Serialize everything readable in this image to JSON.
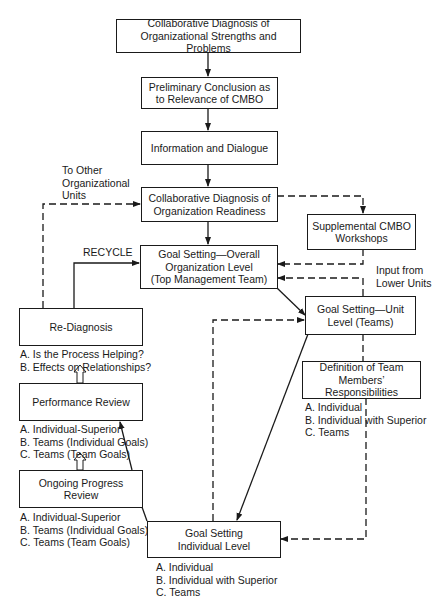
{
  "boxes": {
    "org_diagnosis": {
      "lines": [
        "Collaborative Diagnosis of",
        "Organizational Strengths and Problems"
      ]
    },
    "preliminary": {
      "lines": [
        "Preliminary Conclusion as",
        "to Relevance of CMBO"
      ]
    },
    "information": {
      "lines": [
        "Information and Dialogue"
      ]
    },
    "readiness": {
      "lines": [
        "Collaborative Diagnosis of",
        "Organization Readiness"
      ]
    },
    "supplemental": {
      "lines": [
        "Supplemental CMBO",
        "Workshops"
      ]
    },
    "overall": {
      "lines": [
        "Goal Setting—Overall",
        "Organization Level",
        "(Top Management Team)"
      ]
    },
    "unit": {
      "lines": [
        "Goal Setting—Unit",
        "Level (Teams)"
      ]
    },
    "rediagnosis": {
      "lines": [
        "Re-Diagnosis"
      ]
    },
    "definition": {
      "lines": [
        "Definition of Team",
        "Members’ Responsibilities"
      ]
    },
    "performance": {
      "lines": [
        "Performance Review"
      ]
    },
    "ongoing": {
      "lines": [
        "Ongoing Progress",
        "Review"
      ]
    },
    "individual": {
      "lines": [
        "Goal Setting",
        "Individual Level"
      ]
    }
  },
  "labels": {
    "other_units": [
      "To Other",
      "Organizational",
      "Units"
    ],
    "recycle": "RECYCLE",
    "input_lower": [
      "Input from",
      "Lower Units"
    ],
    "rediagnosis_items": [
      "A. Is the Process Helping?",
      "B. Effects on Relationships?"
    ],
    "definition_items": [
      "A. Individual",
      "B. Individual with Superior",
      "C. Teams"
    ],
    "performance_items": [
      "A. Individual-Superior",
      "B. Teams (Individual Goals)",
      "C. Teams (Team Goals)"
    ],
    "ongoing_items": [
      "A. Individual-Superior",
      "B. Teams (Individual Goals)",
      "C. Teams (Team Goals)"
    ],
    "individual_items": [
      "A. Individual",
      "B. Individual with Superior",
      "C. Teams"
    ]
  }
}
